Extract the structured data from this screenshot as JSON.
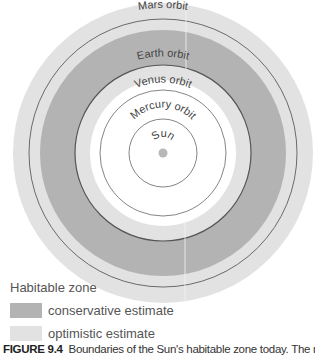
{
  "diagram": {
    "center": [
      163,
      153
    ],
    "colors": {
      "optimistic": "#e2e2e2",
      "conservative": "#b3b3b3",
      "orbit_line": "#6a6a6a",
      "sun": "#b8b8b8",
      "background": "#ffffff"
    },
    "zones": {
      "optimistic_outer_radius": 150,
      "conservative_outer_radius": 123,
      "conservative_inner_radius": 88,
      "optimistic_inner_radius": 73
    },
    "orbits": [
      {
        "name": "Mars",
        "label": "Mars orbit",
        "radius": 134
      },
      {
        "name": "Earth",
        "label": "Earth orbit",
        "radius": 88
      },
      {
        "name": "Venus",
        "label": "Venus orbit",
        "radius": 63
      },
      {
        "name": "Mercury",
        "label": "Mercury orbit",
        "radius": 34
      }
    ],
    "sun": {
      "label": "Sun",
      "radius": 4
    }
  },
  "legend": {
    "title": "Habitable zone",
    "items": [
      {
        "label": "conservative estimate",
        "color": "#b3b3b3"
      },
      {
        "label": "optimistic estimate",
        "color": "#e2e2e2"
      }
    ]
  },
  "caption": {
    "figure_number": "FIGURE 9.4",
    "text": "Boundaries of the Sun's habitable zone today. The narrower"
  }
}
